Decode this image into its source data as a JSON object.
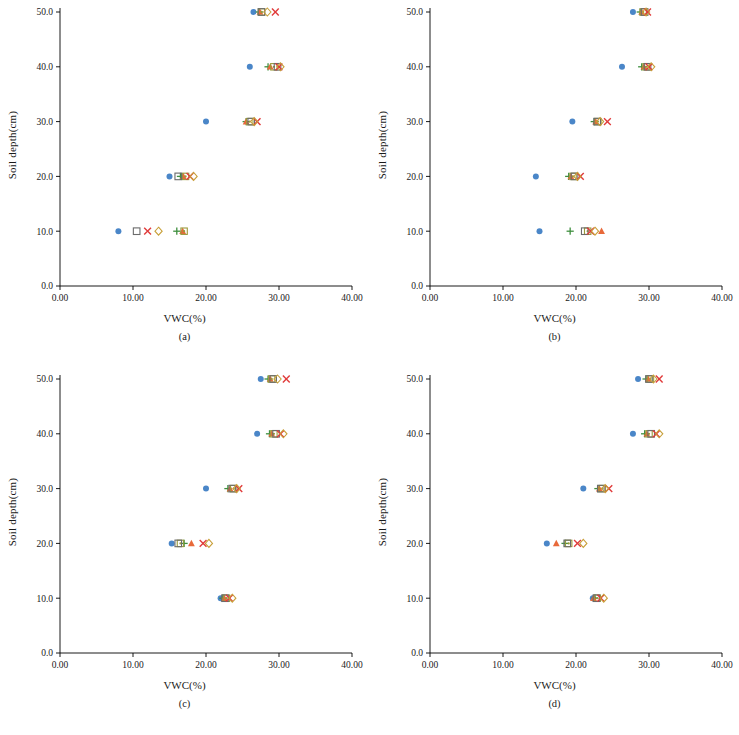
{
  "figure": {
    "panel_count": 4,
    "axis": {
      "xlabel": "VWC(%)",
      "ylabel": "Soil depth(cm)",
      "xticks": [
        "0.00",
        "10.00",
        "20.00",
        "30.00",
        "40.00"
      ],
      "yticks": [
        "0.0",
        "10.0",
        "20.0",
        "30.0",
        "40.0",
        "50.0"
      ],
      "xlim": [
        0,
        40
      ],
      "ylim": [
        0,
        50
      ]
    },
    "series_styles": [
      {
        "name": "blue-circle",
        "marker": "filled-circle",
        "color": "#4a86c8"
      },
      {
        "name": "green-plus",
        "marker": "plus",
        "color": "#3f8f3f"
      },
      {
        "name": "orange-triangle",
        "marker": "filled-triangle",
        "color": "#e8693a"
      },
      {
        "name": "olive-square-dot",
        "marker": "square-with-dot",
        "color": "#9a9a3a"
      },
      {
        "name": "open-square",
        "marker": "open-square",
        "color": "#6b6b6b"
      },
      {
        "name": "red-x",
        "marker": "x-cross",
        "color": "#e03a3a"
      },
      {
        "name": "open-diamond",
        "marker": "open-diamond",
        "color": "#c8a03a"
      }
    ],
    "panels": [
      {
        "id": "a",
        "caption": "(a)"
      },
      {
        "id": "b",
        "caption": "(b)"
      },
      {
        "id": "c",
        "caption": "(c)"
      },
      {
        "id": "d",
        "caption": "(d)"
      }
    ]
  },
  "chart_data": [
    {
      "type": "scatter",
      "panel": "(a)",
      "title": "",
      "xlabel": "VWC(%)",
      "ylabel": "Soil depth(cm)",
      "xlim": [
        0,
        40
      ],
      "ylim": [
        0,
        50
      ],
      "grid": false,
      "y_categories": [
        10,
        20,
        30,
        40,
        50
      ],
      "series": [
        {
          "name": "blue-circle",
          "marker": "filled-circle",
          "color": "#4a86c8",
          "x": [
            8.0,
            15.0,
            20.0,
            26.0,
            26.5
          ],
          "y": [
            10,
            20,
            30,
            40,
            50
          ]
        },
        {
          "name": "green-plus",
          "marker": "plus",
          "color": "#3f8f3f",
          "x": [
            16.0,
            16.5,
            25.5,
            28.5,
            27.3
          ],
          "y": [
            10,
            20,
            30,
            40,
            50
          ]
        },
        {
          "name": "orange-triangle",
          "marker": "filled-triangle",
          "color": "#e8693a",
          "x": [
            16.8,
            16.9,
            25.5,
            28.8,
            27.4
          ],
          "y": [
            10,
            20,
            30,
            40,
            50
          ]
        },
        {
          "name": "olive-square-dot",
          "marker": "square-with-dot",
          "color": "#9a9a3a",
          "x": [
            17.0,
            17.2,
            26.0,
            29.3,
            27.6
          ],
          "y": [
            10,
            20,
            30,
            40,
            50
          ]
        },
        {
          "name": "open-square",
          "marker": "open-square",
          "color": "#6b6b6b",
          "x": [
            10.5,
            16.2,
            26.2,
            29.8,
            27.6
          ],
          "y": [
            10,
            20,
            30,
            40,
            50
          ]
        },
        {
          "name": "red-x",
          "marker": "x-cross",
          "color": "#e03a3a",
          "x": [
            12.0,
            17.8,
            27.0,
            30.0,
            29.5
          ],
          "y": [
            10,
            20,
            30,
            40,
            50
          ]
        },
        {
          "name": "open-diamond",
          "marker": "open-diamond",
          "color": "#c8a03a",
          "x": [
            13.5,
            18.3,
            26.6,
            30.2,
            28.4
          ],
          "y": [
            10,
            20,
            30,
            40,
            50
          ]
        }
      ]
    },
    {
      "type": "scatter",
      "panel": "(b)",
      "title": "",
      "xlabel": "VWC(%)",
      "ylabel": "Soil depth(cm)",
      "xlim": [
        0,
        40
      ],
      "ylim": [
        0,
        50
      ],
      "grid": false,
      "y_categories": [
        10,
        20,
        30,
        40,
        50
      ],
      "series": [
        {
          "name": "blue-circle",
          "marker": "filled-circle",
          "color": "#4a86c8",
          "x": [
            15.0,
            14.5,
            19.5,
            26.3,
            27.8
          ],
          "y": [
            10,
            20,
            30,
            40,
            50
          ]
        },
        {
          "name": "green-plus",
          "marker": "plus",
          "color": "#3f8f3f",
          "x": [
            19.2,
            19.0,
            22.5,
            29.0,
            28.8
          ],
          "y": [
            10,
            20,
            30,
            40,
            50
          ]
        },
        {
          "name": "orange-triangle",
          "marker": "filled-triangle",
          "color": "#e8693a",
          "x": [
            23.5,
            19.3,
            22.7,
            29.3,
            29.0
          ],
          "y": [
            10,
            20,
            30,
            40,
            50
          ]
        },
        {
          "name": "olive-square-dot",
          "marker": "square-with-dot",
          "color": "#9a9a3a",
          "x": [
            21.6,
            19.6,
            23.0,
            29.6,
            29.2
          ],
          "y": [
            10,
            20,
            30,
            40,
            50
          ]
        },
        {
          "name": "open-square",
          "marker": "open-square",
          "color": "#6b6b6b",
          "x": [
            21.2,
            19.8,
            22.9,
            29.8,
            29.4
          ],
          "y": [
            10,
            20,
            30,
            40,
            50
          ]
        },
        {
          "name": "red-x",
          "marker": "x-cross",
          "color": "#e03a3a",
          "x": [
            22.0,
            20.6,
            24.3,
            30.0,
            29.8
          ],
          "y": [
            10,
            20,
            30,
            40,
            50
          ]
        },
        {
          "name": "open-diamond",
          "marker": "open-diamond",
          "color": "#c8a03a",
          "x": [
            22.6,
            20.2,
            23.3,
            30.3,
            29.6
          ],
          "y": [
            10,
            20,
            30,
            40,
            50
          ]
        }
      ]
    },
    {
      "type": "scatter",
      "panel": "(c)",
      "title": "",
      "xlabel": "VWC(%)",
      "ylabel": "Soil depth(cm)",
      "xlim": [
        0,
        40
      ],
      "ylim": [
        0,
        50
      ],
      "grid": false,
      "y_categories": [
        10,
        20,
        30,
        40,
        50
      ],
      "series": [
        {
          "name": "blue-circle",
          "marker": "filled-circle",
          "color": "#4a86c8",
          "x": [
            22.0,
            15.3,
            20.0,
            27.0,
            27.5
          ],
          "y": [
            10,
            20,
            30,
            40,
            50
          ]
        },
        {
          "name": "green-plus",
          "marker": "plus",
          "color": "#3f8f3f",
          "x": [
            22.3,
            17.0,
            23.0,
            28.7,
            28.5
          ],
          "y": [
            10,
            20,
            30,
            40,
            50
          ]
        },
        {
          "name": "orange-triangle",
          "marker": "filled-triangle",
          "color": "#e8693a",
          "x": [
            22.5,
            18.0,
            23.3,
            29.0,
            28.8
          ],
          "y": [
            10,
            20,
            30,
            40,
            50
          ]
        },
        {
          "name": "olive-square-dot",
          "marker": "square-with-dot",
          "color": "#9a9a3a",
          "x": [
            22.8,
            16.5,
            23.8,
            29.3,
            29.0
          ],
          "y": [
            10,
            20,
            30,
            40,
            50
          ]
        },
        {
          "name": "open-square",
          "marker": "open-square",
          "color": "#6b6b6b",
          "x": [
            22.6,
            16.2,
            23.6,
            29.6,
            29.2
          ],
          "y": [
            10,
            20,
            30,
            40,
            50
          ]
        },
        {
          "name": "red-x",
          "marker": "x-cross",
          "color": "#e03a3a",
          "x": [
            23.2,
            19.6,
            24.5,
            30.2,
            31.0
          ],
          "y": [
            10,
            20,
            30,
            40,
            50
          ]
        },
        {
          "name": "open-diamond",
          "marker": "open-diamond",
          "color": "#c8a03a",
          "x": [
            23.6,
            20.4,
            24.2,
            30.6,
            29.8
          ],
          "y": [
            10,
            20,
            30,
            40,
            50
          ]
        }
      ]
    },
    {
      "type": "scatter",
      "panel": "(d)",
      "title": "",
      "xlabel": "VWC(%)",
      "ylabel": "Soil depth(cm)",
      "xlim": [
        0,
        40
      ],
      "ylim": [
        0,
        50
      ],
      "grid": false,
      "y_categories": [
        10,
        20,
        30,
        40,
        50
      ],
      "series": [
        {
          "name": "blue-circle",
          "marker": "filled-circle",
          "color": "#4a86c8",
          "x": [
            22.3,
            16.0,
            21.0,
            27.8,
            28.5
          ],
          "y": [
            10,
            20,
            30,
            40,
            50
          ]
        },
        {
          "name": "green-plus",
          "marker": "plus",
          "color": "#3f8f3f",
          "x": [
            22.6,
            18.5,
            23.0,
            29.4,
            29.6
          ],
          "y": [
            10,
            20,
            30,
            40,
            50
          ]
        },
        {
          "name": "orange-triangle",
          "marker": "filled-triangle",
          "color": "#e8693a",
          "x": [
            22.4,
            17.3,
            23.2,
            29.7,
            29.9
          ],
          "y": [
            10,
            20,
            30,
            40,
            50
          ]
        },
        {
          "name": "olive-square-dot",
          "marker": "square-with-dot",
          "color": "#9a9a3a",
          "x": [
            22.9,
            19.0,
            23.6,
            30.0,
            30.2
          ],
          "y": [
            10,
            20,
            30,
            40,
            50
          ]
        },
        {
          "name": "open-square",
          "marker": "open-square",
          "color": "#6b6b6b",
          "x": [
            22.8,
            18.8,
            23.4,
            30.3,
            30.0
          ],
          "y": [
            10,
            20,
            30,
            40,
            50
          ]
        },
        {
          "name": "red-x",
          "marker": "x-cross",
          "color": "#e03a3a",
          "x": [
            23.4,
            20.2,
            24.5,
            31.0,
            31.4
          ],
          "y": [
            10,
            20,
            30,
            40,
            50
          ]
        },
        {
          "name": "open-diamond",
          "marker": "open-diamond",
          "color": "#c8a03a",
          "x": [
            23.8,
            21.0,
            24.0,
            31.4,
            30.6
          ],
          "y": [
            10,
            20,
            30,
            40,
            50
          ]
        }
      ]
    }
  ]
}
